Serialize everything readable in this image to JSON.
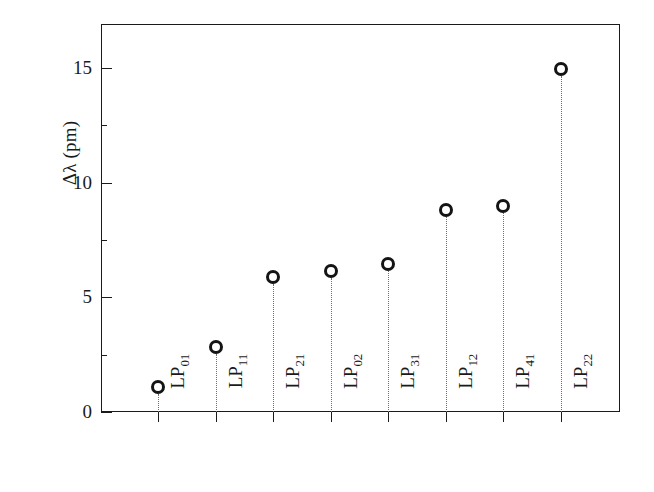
{
  "chart_data": {
    "type": "scatter",
    "title": "",
    "xlabel": "",
    "ylabel": "Δλ (pm)",
    "ylim": [
      0,
      17
    ],
    "grid": false,
    "legend": null,
    "marker_style": "open-circle",
    "stem_style": "dotted",
    "categories": [
      "LP01",
      "LP11",
      "LP21",
      "LP02",
      "LP31",
      "LP12",
      "LP41",
      "LP22"
    ],
    "category_labels": [
      {
        "base": "LP",
        "sub": "01"
      },
      {
        "base": "LP",
        "sub": "11"
      },
      {
        "base": "LP",
        "sub": "21"
      },
      {
        "base": "LP",
        "sub": "02"
      },
      {
        "base": "LP",
        "sub": "31"
      },
      {
        "base": "LP",
        "sub": "12"
      },
      {
        "base": "LP",
        "sub": "41"
      },
      {
        "base": "LP",
        "sub": "22"
      }
    ],
    "values": [
      1.1,
      2.85,
      5.9,
      6.15,
      6.45,
      8.8,
      9.0,
      14.95
    ],
    "y_ticks_major": [
      0,
      5,
      10,
      15
    ],
    "y_tick_labels": [
      "0",
      "5",
      "10",
      "15"
    ],
    "y_ticks_minor": [
      2.5,
      7.5,
      12.5
    ]
  },
  "colors": {
    "axis": "#1a1a1a",
    "marker": "#141414",
    "stem": "#6e6e6e",
    "background": "#ffffff"
  }
}
